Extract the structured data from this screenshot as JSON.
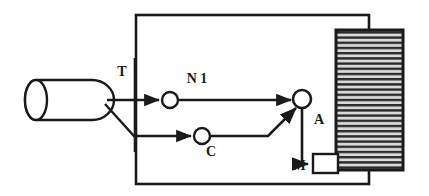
{
  "diagram": {
    "type": "block-flow-diagram",
    "colors": {
      "stroke": "#1a1a1a",
      "fill": "#ffffff",
      "hatch": "#2b2b2b",
      "hatch_background": "#d9d9d9"
    },
    "labels": {
      "tank": "",
      "junction_t": "T",
      "node_n1": "N 1",
      "node_c": "C",
      "node_a": "A",
      "box_m": "M"
    },
    "components": [
      {
        "id": "tank",
        "name": "cylinder-tank",
        "shape": "cylinder",
        "x": 25,
        "y": 80,
        "width": 90,
        "height": 40
      },
      {
        "id": "junction-t",
        "name": "junction-t",
        "shape": "vertical-line",
        "label": "T",
        "x": 135,
        "y_top": 60,
        "y_bottom": 150
      },
      {
        "id": "node-n1",
        "name": "node-n1",
        "shape": "circle",
        "label": "N 1",
        "cx": 170,
        "cy": 100,
        "r": 8
      },
      {
        "id": "node-c",
        "name": "node-c",
        "shape": "circle",
        "label": "C",
        "cx": 202,
        "cy": 136,
        "r": 8
      },
      {
        "id": "node-a",
        "name": "node-a",
        "shape": "circle",
        "label": "A",
        "cx": 302,
        "cy": 99,
        "r": 9
      },
      {
        "id": "box-m",
        "name": "box-m",
        "shape": "rectangle",
        "label": "M",
        "x": 312,
        "y": 155,
        "width": 25,
        "height": 18
      },
      {
        "id": "hatched-block",
        "name": "hatched-block",
        "shape": "rectangle-hatched",
        "x": 336,
        "y": 30,
        "width": 67,
        "height": 140
      },
      {
        "id": "outer-loop",
        "name": "outer-loop-rectangle",
        "shape": "rectangle",
        "x": 135,
        "y": 14,
        "width": 235,
        "height": 171
      }
    ],
    "connections": [
      {
        "from": "tank",
        "to": "node-n1",
        "arrow": true
      },
      {
        "from": "tank",
        "to": "node-c",
        "arrow": true
      },
      {
        "from": "node-n1",
        "to": "node-a",
        "arrow": true
      },
      {
        "from": "node-c",
        "to": "node-a",
        "arrow": true
      },
      {
        "from": "node-a",
        "to": "box-m",
        "arrow": true
      },
      {
        "from": "hatched-block",
        "to": "outer-loop",
        "arrow": false
      }
    ]
  }
}
